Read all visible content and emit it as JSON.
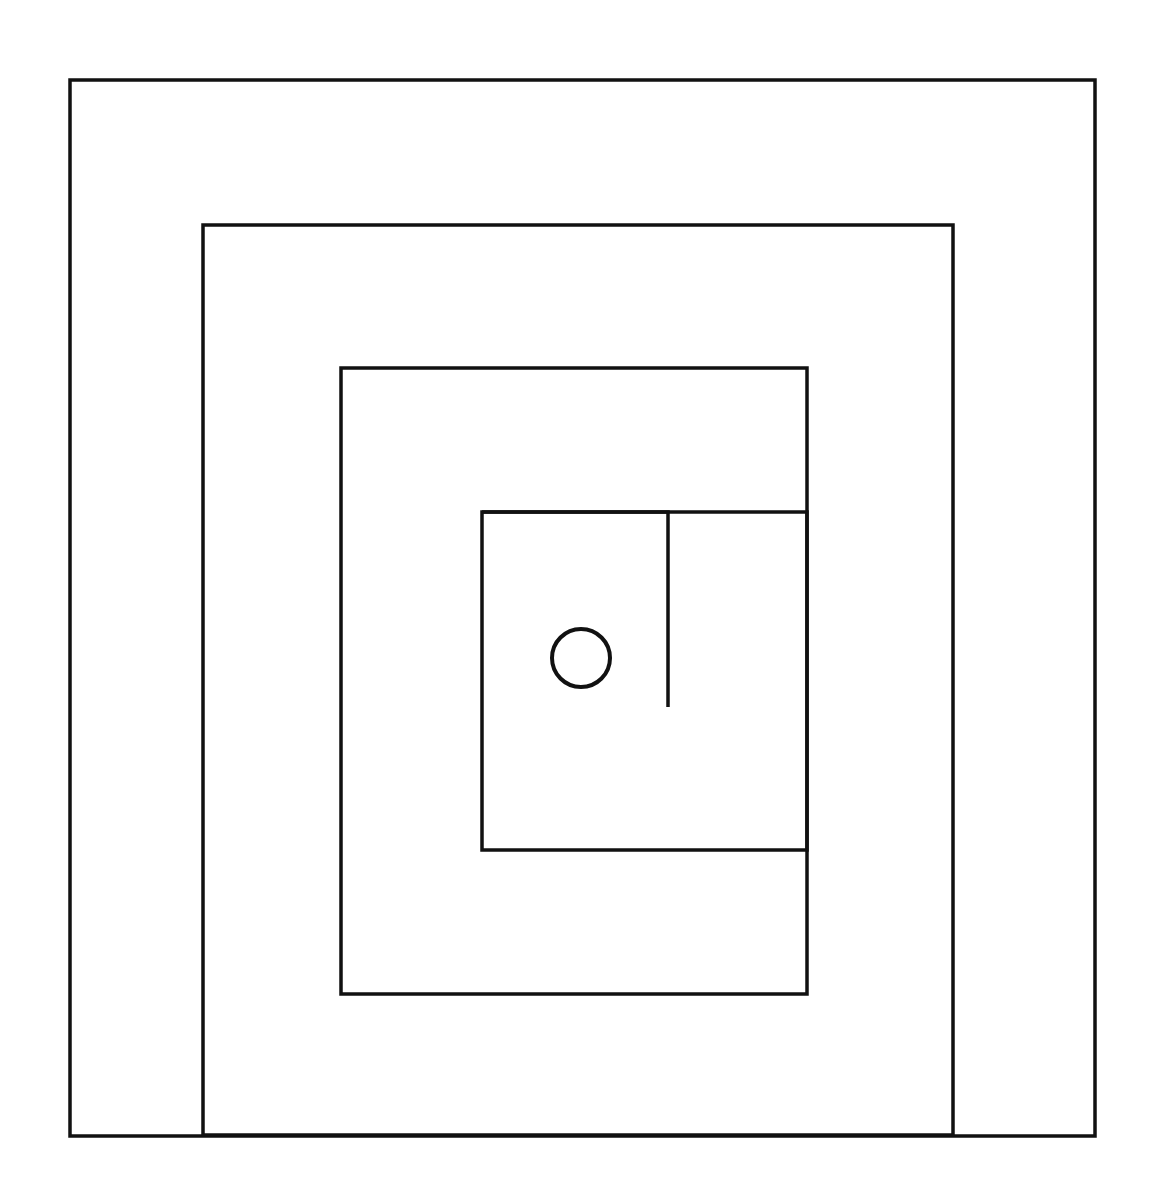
{
  "page": {
    "width": 1155,
    "height": 1194,
    "background_color": "#ffffff",
    "stroke_color": "#111111",
    "fill": "none"
  },
  "figure": {
    "name": "concentric-nested-rectangles-with-circle",
    "stroke_width_outer": 3.5,
    "stroke_width_inner": 3.5,
    "shapes": [
      {
        "id": "rect-1",
        "label": "Outermost rectangle",
        "type": "rect",
        "x": 70,
        "y": 80,
        "width": 1025,
        "height": 1056,
        "stroke": "#111111",
        "stroke_width": 3.5,
        "fill": "none"
      },
      {
        "id": "rect-2",
        "label": "Second rectangle",
        "type": "rect",
        "x": 203,
        "y": 225,
        "width": 750,
        "height": 910,
        "stroke": "#111111",
        "stroke_width": 3.5,
        "fill": "none"
      },
      {
        "id": "rect-3",
        "label": "Third rectangle",
        "type": "rect",
        "x": 341,
        "y": 368,
        "width": 466,
        "height": 626,
        "stroke": "#111111",
        "stroke_width": 3.5,
        "fill": "none"
      },
      {
        "id": "rect-4",
        "label": "Innermost rectangle",
        "type": "rect",
        "x": 482,
        "y": 512,
        "width": 325,
        "height": 338,
        "stroke": "#111111",
        "stroke_width": 3.5,
        "fill": "none"
      },
      {
        "id": "open-hook-line",
        "label": "Open hook line inside innermost rectangle",
        "type": "polyline",
        "points": "482,512 668,512 668,707",
        "stroke": "#111111",
        "stroke_width": 3.5,
        "fill": "none"
      },
      {
        "id": "circle-1",
        "label": "Small circle",
        "type": "circle",
        "cx": 581,
        "cy": 658,
        "r": 29,
        "stroke": "#111111",
        "stroke_width": 4,
        "fill": "none"
      }
    ]
  },
  "chart_data": {
    "type": "diagram",
    "xlabel": "",
    "ylabel": "",
    "grid": false,
    "legend": "none",
    "xlim": [
      0,
      1155
    ],
    "ylim": [
      0,
      1194
    ],
    "elements": [
      {
        "shape": "rectangle",
        "name": "rect-1",
        "left": 70,
        "top": 80,
        "right": 1095,
        "bottom": 1136,
        "width": 1025,
        "height": 1056,
        "closed": true
      },
      {
        "shape": "rectangle",
        "name": "rect-2",
        "left": 203,
        "top": 225,
        "right": 953,
        "bottom": 1135,
        "width": 750,
        "height": 910,
        "closed": true
      },
      {
        "shape": "rectangle",
        "name": "rect-3",
        "left": 341,
        "top": 368,
        "right": 807,
        "bottom": 994,
        "width": 466,
        "height": 626,
        "closed": true
      },
      {
        "shape": "rectangle",
        "name": "rect-4",
        "left": 482,
        "top": 512,
        "right": 807,
        "bottom": 850,
        "width": 325,
        "height": 338,
        "closed": true
      },
      {
        "shape": "polyline",
        "name": "open-hook-line",
        "points": [
          [
            482,
            512
          ],
          [
            668,
            512
          ],
          [
            668,
            707
          ]
        ],
        "closed": false
      },
      {
        "shape": "circle",
        "name": "circle-1",
        "cx": 581,
        "cy": 658,
        "r": 29
      }
    ],
    "counts": {
      "rectangles": 4,
      "circles": 1,
      "open_polylines": 1
    }
  }
}
